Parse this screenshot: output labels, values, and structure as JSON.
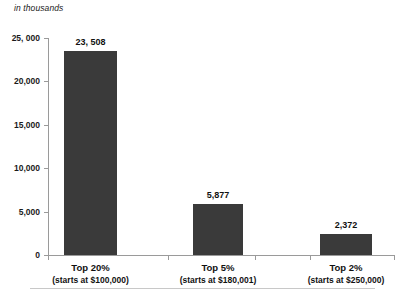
{
  "chart_data": {
    "type": "bar",
    "title": "",
    "subtitle": "",
    "unit_label": "in thousands",
    "xlabel": "",
    "ylabel": "",
    "categories": [
      "Top 20%",
      "Top 5%",
      "Top 2%"
    ],
    "category_sublabels": [
      "(starts at $100,000)",
      "(starts at $180,001)",
      "(starts at $250,000)"
    ],
    "values": [
      23508,
      5877,
      2372
    ],
    "value_labels": [
      "23, 508",
      "5,877",
      "2,372"
    ],
    "ylim": [
      0,
      25000
    ],
    "yticks": [
      0,
      5000,
      10000,
      15000,
      20000,
      25000
    ],
    "ytick_labels": [
      "0",
      "5,000",
      "10,000",
      "15,000",
      "20,000",
      "25, 000"
    ],
    "grid": false,
    "legend": "none",
    "bar_color": "#3a3a3a",
    "axis_color": "#9a9a9a",
    "text_color": "#111111"
  },
  "footnote": {
    "text": ""
  }
}
